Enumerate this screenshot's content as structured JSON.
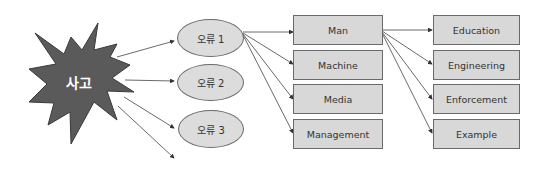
{
  "diagram": {
    "accident": {
      "label": "사고",
      "fill": "#5a5a5a"
    },
    "errors": [
      {
        "label": "오류 1"
      },
      {
        "label": "오류 2"
      },
      {
        "label": "오류 3"
      }
    ],
    "causes_4m": [
      {
        "label": "Man"
      },
      {
        "label": "Machine"
      },
      {
        "label": "Media"
      },
      {
        "label": "Management"
      }
    ],
    "countermeasures_4e": [
      {
        "label": "Education"
      },
      {
        "label": "Engineering"
      },
      {
        "label": "Enforcement"
      },
      {
        "label": "Example"
      }
    ],
    "colors": {
      "box_fill": "#d8d8d8",
      "border": "#6a6a6a",
      "arrow": "#444444"
    }
  }
}
